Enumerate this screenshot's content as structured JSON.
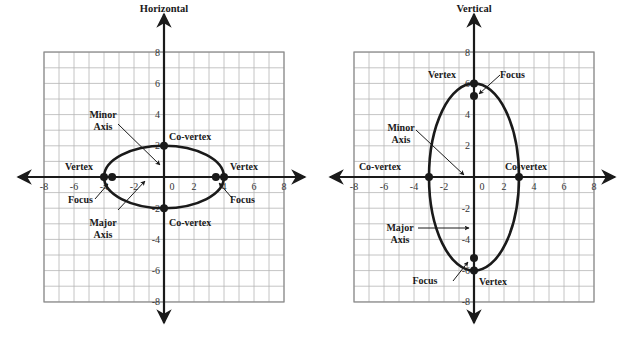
{
  "colors": {
    "grid": "#b5b5b5",
    "grid_border": "#8c8c8c",
    "axis": "#1a1a1a",
    "ellipse": "#1a1a1a",
    "text": "#1a1a1a",
    "tick_text": "#333333"
  },
  "graphs": [
    {
      "id": "horizontal",
      "title": "Horizontal",
      "origin_px": [
        164,
        177
      ],
      "grid_px": {
        "x0": 44,
        "x1": 284,
        "y0": 52,
        "y1": 302
      },
      "unit_px": {
        "x": 15,
        "y": 15.6
      },
      "axis_px": {
        "x_left": 18,
        "x_right": 305,
        "y_top": 14,
        "y_bottom": 323
      },
      "x_ticks": [
        -8,
        -6,
        -4,
        -2,
        0,
        2,
        4,
        6,
        8
      ],
      "y_ticks": [
        8,
        6,
        4,
        2,
        -2,
        -4,
        -6,
        -8
      ],
      "ellipse": {
        "a_x": 4,
        "b_y": 2
      },
      "points": [
        {
          "name": "vertex-left",
          "x": -4,
          "y": 0
        },
        {
          "name": "vertex-right",
          "x": 4,
          "y": 0
        },
        {
          "name": "focus-left",
          "x": -3.46,
          "y": 0
        },
        {
          "name": "focus-right",
          "x": 3.46,
          "y": 0
        },
        {
          "name": "co-vertex-top",
          "x": 0,
          "y": 2
        },
        {
          "name": "co-vertex-bottom",
          "x": 0,
          "y": -2
        }
      ],
      "labels": [
        {
          "name": "label-minor-axis",
          "lines": [
            "Minor",
            "Axis"
          ],
          "x": 103,
          "y": 118,
          "anchor": "middle"
        },
        {
          "name": "label-co-vertex-top",
          "lines": [
            "Co-vertex"
          ],
          "x": 169,
          "y": 140,
          "anchor": "start"
        },
        {
          "name": "label-vertex-left",
          "lines": [
            "Vertex"
          ],
          "x": 65,
          "y": 170,
          "anchor": "start"
        },
        {
          "name": "label-vertex-right",
          "lines": [
            "Vertex"
          ],
          "x": 230,
          "y": 170,
          "anchor": "start"
        },
        {
          "name": "label-focus-left",
          "lines": [
            "Focus"
          ],
          "x": 68,
          "y": 203,
          "anchor": "start"
        },
        {
          "name": "label-focus-right",
          "lines": [
            "Focus"
          ],
          "x": 230,
          "y": 203,
          "anchor": "start"
        },
        {
          "name": "label-co-vertex-bottom",
          "lines": [
            "Co-vertex"
          ],
          "x": 169,
          "y": 226,
          "anchor": "start"
        },
        {
          "name": "label-major-axis",
          "lines": [
            "Major",
            "Axis"
          ],
          "x": 103,
          "y": 226,
          "anchor": "middle"
        }
      ],
      "arrows": [
        {
          "name": "minor-axis-pointer",
          "from": [
            118,
            124
          ],
          "to": [
            160,
            165
          ]
        },
        {
          "name": "major-axis-pointer",
          "from": [
            118,
            210
          ],
          "to": [
            145,
            181
          ]
        },
        {
          "name": "focus-left-pointer",
          "from": [
            95,
            199
          ],
          "to": [
            108,
            184
          ]
        },
        {
          "name": "focus-right-pointer",
          "from": [
            232,
            198
          ],
          "to": [
            219,
            183
          ]
        }
      ]
    },
    {
      "id": "vertical",
      "title": "Vertical",
      "origin_px": [
        474,
        177
      ],
      "grid_px": {
        "x0": 354,
        "x1": 594,
        "y0": 52,
        "y1": 302
      },
      "unit_px": {
        "x": 15,
        "y": 15.6
      },
      "axis_px": {
        "x_left": 330,
        "x_right": 615,
        "y_top": 14,
        "y_bottom": 323
      },
      "x_ticks": [
        -8,
        -6,
        -4,
        -2,
        0,
        2,
        4,
        6,
        8
      ],
      "y_ticks": [
        8,
        6,
        4,
        2,
        -2,
        -4,
        -6,
        -8
      ],
      "ellipse": {
        "a_x": 3,
        "b_y": 6
      },
      "points": [
        {
          "name": "vertex-top",
          "x": 0,
          "y": 6
        },
        {
          "name": "vertex-bottom",
          "x": 0,
          "y": -6
        },
        {
          "name": "focus-top",
          "x": 0,
          "y": 5.2
        },
        {
          "name": "focus-bottom",
          "x": 0,
          "y": -5.2
        },
        {
          "name": "co-vertex-left",
          "x": -3,
          "y": 0
        },
        {
          "name": "co-vertex-right",
          "x": 3,
          "y": 0
        }
      ],
      "labels": [
        {
          "name": "label-vertex-top",
          "lines": [
            "Vertex"
          ],
          "x": 442,
          "y": 78,
          "anchor": "middle"
        },
        {
          "name": "label-focus-top",
          "lines": [
            "Focus"
          ],
          "x": 500,
          "y": 78,
          "anchor": "start"
        },
        {
          "name": "label-minor-axis",
          "lines": [
            "Minor",
            "Axis"
          ],
          "x": 401,
          "y": 131,
          "anchor": "middle"
        },
        {
          "name": "label-co-vertex-left",
          "lines": [
            "Co-vertex"
          ],
          "x": 380,
          "y": 170,
          "anchor": "middle"
        },
        {
          "name": "label-co-vertex-right",
          "lines": [
            "Co-vertex"
          ],
          "x": 526,
          "y": 170,
          "anchor": "middle"
        },
        {
          "name": "label-major-axis",
          "lines": [
            "Major",
            "Axis"
          ],
          "x": 400,
          "y": 231,
          "anchor": "middle"
        },
        {
          "name": "label-focus-bottom",
          "lines": [
            "Focus"
          ],
          "x": 425,
          "y": 284,
          "anchor": "middle"
        },
        {
          "name": "label-vertex-bottom",
          "lines": [
            "Vertex"
          ],
          "x": 479,
          "y": 285,
          "anchor": "start"
        }
      ],
      "arrows": [
        {
          "name": "minor-axis-pointer",
          "from": [
            416,
            130
          ],
          "to": [
            464,
            175
          ]
        },
        {
          "name": "major-axis-pointer",
          "from": [
            418,
            228
          ],
          "to": [
            469,
            228
          ]
        },
        {
          "name": "focus-top-pointer",
          "from": [
            500,
            75
          ],
          "to": [
            479,
            94
          ]
        },
        {
          "name": "focus-bottom-pointer",
          "from": [
            453,
            281
          ],
          "to": [
            468,
            262
          ]
        }
      ]
    }
  ]
}
